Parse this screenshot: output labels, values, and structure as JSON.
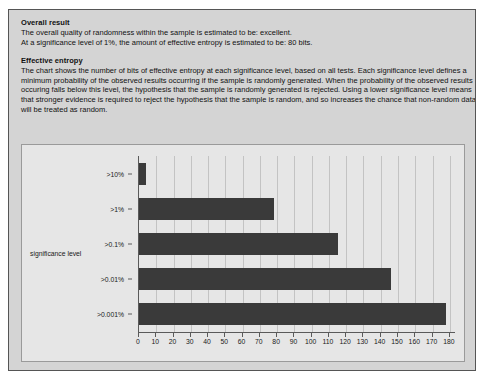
{
  "overall": {
    "heading": "Overall result",
    "lines": [
      "The overall quality of randomness within the sample is estimated to be: excellent.",
      "At a significance level of 1%, the amount of effective entropy is estimated to be: 80 bits."
    ]
  },
  "entropy": {
    "heading": "Effective entropy",
    "lines": [
      "The chart shows the number of bits of effective entropy at each significance level, based on all tests. Each significance level defines a",
      "minimum probability of the observed results occurring if the sample is randomly generated. When the probability of the observed results",
      "occuring falls below this level, the hypothesis that the sample is randomly generated is rejected. Using a lower significance level means",
      "that stronger evidence is required to reject the hypothesis that the sample is random, and so increases the chance that non-random data",
      "will be treated as random."
    ]
  },
  "colors": {
    "panel_background": "#d4d4d4",
    "chart_background": "#e6e6e6",
    "bar_fill": "#3a3a3a",
    "axis": "#5a5a5a",
    "gridline": "#c3c3c3",
    "text": "#111111"
  },
  "chart_data": {
    "type": "bar",
    "orientation": "horizontal",
    "title": "",
    "xlabel": "",
    "ylabel": "significance level",
    "categories": [
      ">10%",
      ">1%",
      ">0.1%",
      ">0.01%",
      ">0.001%"
    ],
    "values": [
      4,
      78,
      115,
      146,
      178
    ],
    "xlim": [
      0,
      183
    ],
    "xticks": [
      0,
      10,
      20,
      30,
      40,
      50,
      60,
      70,
      80,
      90,
      100,
      110,
      120,
      130,
      140,
      150,
      160,
      170,
      180
    ],
    "xticklabels": [
      "0",
      "10",
      "20",
      "30",
      "40",
      "50",
      "60",
      "70",
      "80",
      "90",
      "100",
      "110",
      "120",
      "130",
      "140",
      "150",
      "160",
      "170",
      "180"
    ],
    "grid": true,
    "legend": false
  }
}
